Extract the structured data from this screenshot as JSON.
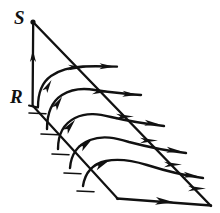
{
  "figure": {
    "kind": "hand-drawn-diagram",
    "title": "",
    "background_color": "#ffffff",
    "ink_color": "#111111",
    "width": 220,
    "height": 213,
    "labels": [
      {
        "id": "S",
        "text": "S",
        "x": 14,
        "y": 24,
        "font_size": 19,
        "description": "label at apex of vertical segment"
      },
      {
        "id": "R",
        "text": "R",
        "x": 10,
        "y": 103,
        "font_size": 19,
        "description": "label at base of vertical segment"
      }
    ],
    "vertices": {
      "apex": {
        "x": 33,
        "y": 22,
        "name": "S-point"
      },
      "base": {
        "x": 33,
        "y": 105,
        "name": "R-point"
      },
      "left_bottom": {
        "x": 117,
        "y": 198,
        "name": "near-corner"
      },
      "right_bottom": {
        "x": 210,
        "y": 205,
        "name": "far-corner"
      }
    },
    "segments": [
      {
        "name": "vertical-SR-segment",
        "from": {
          "x": 33,
          "y": 22
        },
        "to": {
          "x": 33,
          "y": 105
        },
        "arrow": "up",
        "arrow_at": {
          "x": 33,
          "y": 57
        }
      },
      {
        "name": "upper-diagonal-edge",
        "from": {
          "x": 33,
          "y": 22
        },
        "to": {
          "x": 210,
          "y": 205
        },
        "arrow": "none"
      },
      {
        "name": "lower-diagonal-edge",
        "from": {
          "x": 33,
          "y": 105
        },
        "to": {
          "x": 117,
          "y": 198
        },
        "arrow": "none"
      },
      {
        "name": "bottom-edge",
        "from": {
          "x": 117,
          "y": 198
        },
        "to": {
          "x": 210,
          "y": 205
        },
        "arrow": "right",
        "arrow_at": {
          "x": 168,
          "y": 202
        }
      }
    ],
    "streamlines": [
      {
        "name": "streamline-1",
        "path": "M 38,106 C 40,92 44,80 54,74 C 64,68 74,66 84,66 C 96,66 106,66 116,66",
        "arrowheads": [
          {
            "x": 49,
            "y": 84,
            "angle": -62
          },
          {
            "x": 108,
            "y": 66,
            "angle": 0
          }
        ]
      },
      {
        "name": "streamline-2",
        "path": "M 47,128 C 49,112 54,99 65,93 C 76,87 86,88 97,90 C 110,92 125,94 140,95",
        "arrowheads": [
          {
            "x": 59,
            "y": 101,
            "angle": -56
          },
          {
            "x": 131,
            "y": 95,
            "angle": 6
          }
        ]
      },
      {
        "name": "streamline-3",
        "path": "M 58,148 C 61,133 67,122 79,117 C 91,112 102,114 114,117 C 130,121 147,124 163,126",
        "arrowheads": [
          {
            "x": 72,
            "y": 124,
            "angle": -48
          },
          {
            "x": 153,
            "y": 124,
            "angle": 8
          }
        ]
      },
      {
        "name": "streamline-4",
        "path": "M 70,167 C 74,153 81,143 94,139 C 107,135 119,138 132,142 C 150,147 168,151 185,153",
        "arrowheads": [
          {
            "x": 88,
            "y": 142,
            "angle": -36
          },
          {
            "x": 175,
            "y": 151,
            "angle": 8
          }
        ]
      },
      {
        "name": "streamline-5",
        "path": "M 83,185 C 88,172 96,163 110,160 C 124,157 136,160 149,165 C 167,171 186,176 202,178",
        "arrowheads": [
          {
            "x": 104,
            "y": 163,
            "angle": -28
          },
          {
            "x": 192,
            "y": 176,
            "angle": 8
          }
        ]
      }
    ],
    "tick_marks": [
      {
        "name": "tick-1",
        "x1": 30,
        "y1": 113,
        "x2": 46,
        "y2": 113
      },
      {
        "name": "tick-2",
        "x1": 41,
        "y1": 134,
        "x2": 57,
        "y2": 134
      },
      {
        "name": "tick-3",
        "x1": 52,
        "y1": 154,
        "x2": 68,
        "y2": 154
      },
      {
        "name": "tick-4",
        "x1": 64,
        "y1": 173,
        "x2": 80,
        "y2": 173
      },
      {
        "name": "tick-5",
        "x1": 77,
        "y1": 191,
        "x2": 93,
        "y2": 191
      }
    ],
    "edge_arrows": [
      {
        "name": "edge-arrow-1",
        "x": 76,
        "y": 67,
        "angle": 0
      },
      {
        "name": "edge-arrow-2",
        "x": 99,
        "y": 91,
        "angle": 0
      },
      {
        "name": "edge-arrow-3",
        "x": 123,
        "y": 116,
        "angle": 0
      },
      {
        "name": "edge-arrow-4",
        "x": 147,
        "y": 140,
        "angle": 0
      },
      {
        "name": "edge-arrow-5",
        "x": 171,
        "y": 164,
        "angle": 0
      },
      {
        "name": "edge-arrow-6",
        "x": 195,
        "y": 188,
        "angle": 0
      }
    ]
  }
}
